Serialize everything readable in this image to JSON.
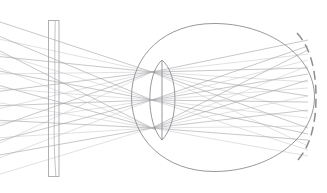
{
  "figure": {
    "name": "eye-light-field-ray-diagram",
    "kind": "optical-ray-diagram",
    "width": 327,
    "height": 193,
    "background": "#ffffff",
    "title": ""
  },
  "colors": {
    "ray": "#9a9a9e",
    "ray_light": "#c2c2c6",
    "outline": "#8d8d92",
    "display_border": "#a8a8ad",
    "lens": "#8d8d92",
    "retina": "#8d8d92"
  },
  "strokes": {
    "ray_width": 0.55,
    "ray_light_width": 0.5,
    "outline_width": 0.9,
    "display_width": 0.9,
    "lens_width": 0.9,
    "retina_width": 1.5,
    "retina_dash": "9 5"
  },
  "display_panel": {
    "label": "display-panel",
    "x": 48.5,
    "y": 20.5,
    "width": 10.5,
    "height": 156,
    "inner_line": "M 55.2 21 C 54.2 55 55.6 88 54.4 120 C 53.6 145 55.0 160 55.8 176"
  },
  "eye": {
    "label": "eye-outline",
    "path": "M 131.5 97 C 131.5 55 165 23.5 214 23.5 C 268 23.5 314.5 55 314.5 97 C 314.5 139 268 171.5 214 171.5 C 165 171.5 131.5 139 131.5 97 Z",
    "center_x": 222,
    "center_y": 97
  },
  "lens": {
    "label": "crystalline-lens",
    "apex_top_x": 162,
    "apex_top_y": 60,
    "apex_bottom_x": 162,
    "apex_bottom_y": 140,
    "front_path": "M 162 60 C 146 74 145.5 122 162 140",
    "back_path": "M 162 60 C 179 74 179.5 122 162 140",
    "mid_path": "M 162 60 L 162 140"
  },
  "retina": {
    "label": "retina-arc",
    "path": "M 297 33 C 311 48 316 72 316 97 C 316 122 311 146 297 161",
    "dash": "9 5"
  },
  "focal_points": [
    {
      "label": "focal-point-upper",
      "x": 152,
      "y": 72
    },
    {
      "label": "focal-point-center",
      "x": 152,
      "y": 100
    },
    {
      "label": "focal-point-lower",
      "x": 152,
      "y": 128
    }
  ],
  "ray_bundles": {
    "description": "Three ray bundles originate off the left edge, pass through the display panel, converge at three focal points in front of the lens, then diverge through the lens onto the retina arc.",
    "source_left_x": -6,
    "source_spread_y": [
      14,
      184
    ],
    "incoming_per_bundle": 8,
    "outgoing_per_bundle": 8
  },
  "chart_data": {
    "type": "line",
    "title": "",
    "xlabel": "",
    "ylabel": "",
    "series": [
      {
        "name": "incoming-rays-upper-bundle",
        "from_x": -6,
        "to_x": 152,
        "to_y": 72,
        "from_y": [
          20,
          38,
          56,
          74,
          92,
          110,
          128,
          146
        ]
      },
      {
        "name": "incoming-rays-center-bundle",
        "from_x": -6,
        "to_x": 152,
        "to_y": 100,
        "from_y": [
          34,
          52,
          70,
          88,
          106,
          124,
          142,
          160
        ]
      },
      {
        "name": "incoming-rays-lower-bundle",
        "from_x": -6,
        "to_x": 152,
        "to_y": 128,
        "from_y": [
          48,
          66,
          84,
          102,
          120,
          138,
          156,
          176
        ]
      },
      {
        "name": "outgoing-rays-upper-bundle",
        "from_x": 152,
        "from_y": 72,
        "to_x": 308,
        "to_y": [
          40,
          54,
          68,
          82,
          96,
          112,
          128,
          146
        ]
      },
      {
        "name": "outgoing-rays-center-bundle",
        "from_x": 152,
        "from_y": 100,
        "to_x": 308,
        "to_y": [
          46,
          60,
          74,
          88,
          102,
          118,
          134,
          150
        ]
      },
      {
        "name": "outgoing-rays-lower-bundle",
        "from_x": 152,
        "from_y": 128,
        "to_x": 308,
        "to_y": [
          50,
          66,
          80,
          96,
          110,
          126,
          140,
          156
        ]
      }
    ]
  }
}
